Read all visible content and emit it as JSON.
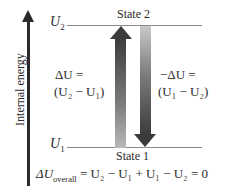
{
  "axis": {
    "label": "Internal energy"
  },
  "levels": {
    "upper": {
      "symbol": "U",
      "subscript": "2",
      "state_label": "State 2"
    },
    "lower": {
      "symbol": "U",
      "subscript": "1",
      "state_label": "State 1"
    }
  },
  "arrows": {
    "up": {
      "line1": "ΔU =",
      "line2": "(U₂ − U₁)"
    },
    "down": {
      "line1": "−ΔU =",
      "line2": "(U₁ − U₂)"
    }
  },
  "equation": {
    "lhs_symbol": "ΔU",
    "lhs_subscript": "overall",
    "rhs": "= U₂ − U₁ + U₁ − U₂ = 0"
  },
  "colors": {
    "line": "#8a8a8a",
    "arrow_dark": "#3a3a3a",
    "arrow_light": "#c0c0c0",
    "text": "#2b2b2b"
  }
}
